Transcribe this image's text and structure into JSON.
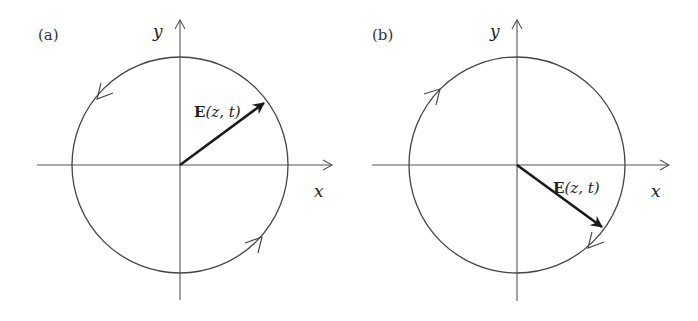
{
  "figure": {
    "panels": [
      {
        "id": "a",
        "label": "(a)",
        "x_axis_label": "x",
        "y_axis_label": "y",
        "vector_label_bold": "E",
        "vector_label_args": "(z, t)",
        "vector_direction": "up-right (first quadrant, ~37° above +x)",
        "rotation": "counter-clockwise"
      },
      {
        "id": "b",
        "label": "(b)",
        "x_axis_label": "x",
        "y_axis_label": "y",
        "vector_label_bold": "E",
        "vector_label_args": "(z, t)",
        "vector_direction": "down-right (fourth quadrant, ~38° below +x)",
        "rotation": "clockwise"
      }
    ],
    "colors": {
      "background": "#ffffff",
      "lines": "#444444",
      "vector": "#1a1a1a"
    }
  }
}
